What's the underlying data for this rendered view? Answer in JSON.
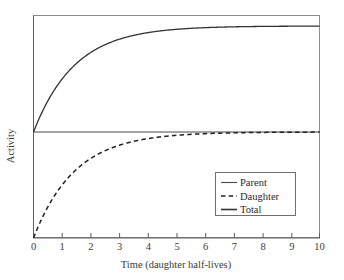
{
  "chart_data": {
    "type": "line",
    "title": "",
    "xlabel": "Time (daughter half-lives)",
    "ylabel": "Activity",
    "xlim": [
      0,
      10
    ],
    "ylim": [
      0,
      2.1
    ],
    "grid": false,
    "legend_position": "lower-right-inside",
    "xticks": [
      "0",
      "1",
      "2",
      "3",
      "4",
      "5",
      "6",
      "7",
      "8",
      "9",
      "10"
    ],
    "xtick_values": [
      0,
      1,
      2,
      3,
      4,
      5,
      6,
      7,
      8,
      9,
      10
    ],
    "yticks": [],
    "x": [
      0,
      0.25,
      0.5,
      0.75,
      1,
      1.25,
      1.5,
      1.75,
      2,
      2.5,
      3,
      3.5,
      4,
      4.5,
      5,
      5.5,
      6,
      6.5,
      7,
      7.5,
      8,
      8.5,
      9,
      9.5,
      10
    ],
    "series": [
      {
        "name": "Parent",
        "style": "solid",
        "color": "#4a4a4a",
        "values": [
          1,
          1,
          1,
          1,
          1,
          1,
          1,
          1,
          1,
          1,
          1,
          1,
          1,
          1,
          1,
          1,
          1,
          1,
          1,
          1,
          1,
          1,
          1,
          1,
          1
        ]
      },
      {
        "name": "Daughter",
        "style": "dashed",
        "color": "#222222",
        "values": [
          0,
          0.159,
          0.293,
          0.405,
          0.5,
          0.58,
          0.646,
          0.703,
          0.75,
          0.823,
          0.875,
          0.912,
          0.938,
          0.956,
          0.969,
          0.978,
          0.984,
          0.989,
          0.992,
          0.995,
          0.996,
          0.997,
          0.998,
          0.999,
          0.999
        ]
      },
      {
        "name": "Total",
        "style": "solid",
        "color": "#333333",
        "values": [
          1,
          1.159,
          1.293,
          1.405,
          1.5,
          1.58,
          1.646,
          1.703,
          1.75,
          1.823,
          1.875,
          1.912,
          1.938,
          1.956,
          1.969,
          1.978,
          1.984,
          1.989,
          1.992,
          1.995,
          1.996,
          1.997,
          1.998,
          1.999,
          1.999
        ]
      }
    ],
    "legend_entries": [
      {
        "label": "Parent",
        "style": "solid"
      },
      {
        "label": "Daughter",
        "style": "dashed"
      },
      {
        "label": "Total",
        "style": "solid"
      }
    ]
  },
  "colors": {
    "background": "#ffffff",
    "frame": "#8d8d8d",
    "axis": "#5e5e5e",
    "text": "#2b2b2b"
  }
}
